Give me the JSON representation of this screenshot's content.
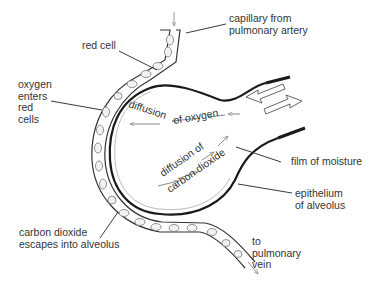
{
  "diagram": {
    "labels": {
      "capillary_from": "capillary from\npulmonary artery",
      "red_cell": "red cell",
      "oxygen_enters": "oxygen\nenters\nred\ncells",
      "film_of_moisture": "film of moisture",
      "epithelium": "epithelium\nof alveolus",
      "co2_escapes": "carbon dioxide\nescapes into alveolus",
      "to_vein": "to\npulmonary\nvein"
    },
    "inner_text": {
      "diffusion_o2_word1": "diffusion",
      "diffusion_o2_word2": "of oxygen",
      "diffusion_co2_line1": "diffusion of",
      "diffusion_co2_line2": "carbon dioxide"
    },
    "colors": {
      "line": "#222222",
      "membrane": "#1a1a1a",
      "background": "#ffffff"
    }
  }
}
